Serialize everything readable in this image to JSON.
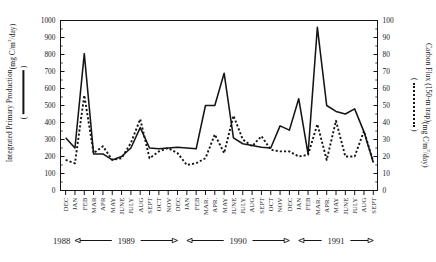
{
  "figure": {
    "background_color": "#ffffff",
    "line_color": "#141414"
  },
  "left_axis": {
    "title_line1": "Integrated Primary Production",
    "title_line2": "( mg C/m2/day )",
    "title_main": "Integrated Primary Production",
    "title_units": "(mg C/m",
    "title_units_exp": "2",
    "title_units_tail": "/day)",
    "legend_symbol": "solid-line",
    "paren_open": "(",
    "paren_close": ")",
    "ticks": [
      0,
      100,
      200,
      300,
      400,
      500,
      600,
      700,
      800,
      900,
      1000
    ],
    "tick_labels": [
      "0",
      "100",
      "200",
      "300",
      "400",
      "500",
      "600",
      "700",
      "800",
      "900",
      "1000"
    ],
    "min": 0,
    "max": 1000
  },
  "right_axis": {
    "title_main": "Carbon Flux (150-m trap)",
    "title_units": "(mg C/m",
    "title_units_exp": "2",
    "title_units_tail": "/day)",
    "legend_symbol": "dotted-line",
    "paren_open": "(",
    "paren_close": ")",
    "ticks": [
      0,
      10,
      20,
      30,
      40,
      50,
      60,
      70,
      80,
      90,
      100
    ],
    "tick_labels": [
      "0",
      "10",
      "20",
      "30",
      "40",
      "50",
      "60",
      "70",
      "80",
      "90",
      "100"
    ],
    "min": 0,
    "max": 100
  },
  "x_axis": {
    "tick_labels": [
      "DEC",
      "JAN",
      "FEB",
      "MAR",
      "APR",
      "MAY",
      "JUNE",
      "JULY",
      "AUG",
      "SEPT",
      "OCT",
      "NOV",
      "DEC",
      "JAN",
      "FEB",
      "MAR.",
      "APR.",
      "MAY",
      "JUNE",
      "JULY",
      "AUG",
      "SEPT",
      "OCT",
      "NOV",
      "DEC",
      "JAN",
      "FEB",
      "MAR.",
      "APR.",
      "MAY",
      "JUNE",
      "JULY",
      "AUG",
      "SEPT"
    ]
  },
  "year_bands": [
    {
      "label": "1988",
      "start_index": 0,
      "end_index": 0,
      "style": "label-only"
    },
    {
      "label": "1989",
      "start_index": 1,
      "end_index": 12,
      "style": "arrow-both"
    },
    {
      "label": "1990",
      "start_index": 13,
      "end_index": 24,
      "style": "arrow-both"
    },
    {
      "label": "1991",
      "start_index": 25,
      "end_index": 33,
      "style": "arrow-right"
    }
  ],
  "chart_data": {
    "type": "line",
    "title": "",
    "xlabel": "",
    "ylabel": "Integrated Primary Production (mg C/m2/day)",
    "ylabel_right": "Carbon Flux (150-m trap) (mg C/m2/day)",
    "ylim": [
      0,
      1000
    ],
    "ylim_right": [
      0,
      100
    ],
    "grid": false,
    "legend_position": "axis-titles",
    "categories": [
      "DEC 1988",
      "JAN 1989",
      "FEB 1989",
      "MAR 1989",
      "APR 1989",
      "MAY 1989",
      "JUNE 1989",
      "JULY 1989",
      "AUG 1989",
      "SEPT 1989",
      "OCT 1989",
      "NOV 1989",
      "DEC 1989",
      "JAN 1990",
      "FEB 1990",
      "MAR. 1990",
      "APR. 1990",
      "MAY 1990",
      "JUNE 1990",
      "JULY 1990",
      "AUG 1990",
      "SEPT 1990",
      "OCT 1990",
      "NOV 1990",
      "DEC 1990",
      "JAN 1991",
      "FEB 1991",
      "MAR. 1991",
      "APR. 1991",
      "MAY 1991",
      "JUNE 1991",
      "JULY 1991",
      "AUG 1991",
      "SEPT 1991"
    ],
    "series": [
      {
        "name": "Integrated Primary Production",
        "axis": "left",
        "units": "mg C/m2/day",
        "line_style": "solid",
        "color": "#141414",
        "values": [
          310,
          250,
          805,
          215,
          215,
          180,
          200,
          250,
          370,
          250,
          245,
          250,
          255,
          250,
          245,
          500,
          500,
          690,
          310,
          275,
          265,
          255,
          250,
          380,
          355,
          540,
          215,
          960,
          500,
          465,
          450,
          480,
          345,
          165
        ]
      },
      {
        "name": "Carbon Flux (150-m trap)",
        "axis": "right",
        "units": "mg C/m2/day",
        "line_style": "dotted",
        "color": "#141414",
        "values": [
          18,
          16,
          56,
          22,
          26,
          18,
          19,
          28,
          42,
          19,
          23,
          25,
          22,
          15,
          16,
          19,
          33,
          22,
          44,
          30,
          26,
          32,
          24,
          23,
          23,
          20,
          21,
          39,
          18,
          41,
          20,
          20,
          35,
          17
        ]
      }
    ]
  }
}
